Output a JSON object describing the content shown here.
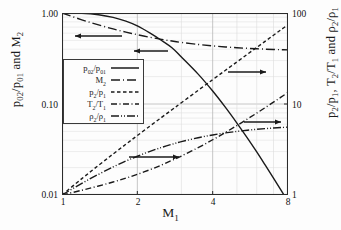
{
  "chart_data": {
    "type": "line",
    "title": "",
    "xlabel": "M1",
    "xlabel_html": "M<sub>1</sub>",
    "ylabel_left": "p02/p01 and M2",
    "ylabel_left_html": "p<sub>02</sub>/p<sub>01</sub>  and  M<sub>2</sub>",
    "ylabel_right": "p2/p1, T2/T1 and rho2/rho1",
    "ylabel_right_html": "p<sub>2</sub>/p<sub>1</sub>,  T<sub>2</sub>/T<sub>1</sub>  and  ρ<sub>2</sub>/ρ<sub>1</sub>",
    "xscale": "log",
    "yscale": "log",
    "xlim": [
      1,
      8
    ],
    "ylim_left": [
      0.01,
      1.0
    ],
    "ylim_right": [
      1,
      100
    ],
    "grid": true,
    "xticks": [
      1,
      2,
      4,
      8
    ],
    "xticklabels": [
      "1",
      "2",
      "4",
      "8"
    ],
    "yticks_left": [
      0.01,
      0.1,
      1.0
    ],
    "yticklabels_left": [
      "0.01",
      "0.10",
      "1.00"
    ],
    "yticks_right": [
      1,
      10,
      100
    ],
    "yticklabels_right": [
      "1",
      "10",
      "100"
    ],
    "legend_position": "center-left",
    "x": [
      1.0,
      1.2,
      1.4,
      1.6,
      1.8,
      2.0,
      2.25,
      2.5,
      2.75,
      3.0,
      3.5,
      4.0,
      4.5,
      5.0,
      5.5,
      6.0,
      6.5,
      7.0,
      7.5,
      8.0
    ],
    "series": [
      {
        "name": "p02/p01",
        "name_html": "p<sub>02</sub>/p<sub>01</sub>",
        "axis": "left",
        "style": "solid",
        "arrow": "left",
        "values": [
          1.0,
          0.9928,
          0.9582,
          0.8952,
          0.8127,
          0.7209,
          0.6005,
          0.499,
          0.4154,
          0.3283,
          0.2129,
          0.1388,
          0.0917,
          0.0617,
          0.0424,
          0.0297,
          0.0211,
          0.0153,
          0.0113,
          0.00849
        ]
      },
      {
        "name": "M2",
        "name_html": "M<sub>2</sub>",
        "axis": "left",
        "style": "longdash",
        "arrow": "left",
        "values": [
          1.0,
          0.8422,
          0.7397,
          0.6684,
          0.6165,
          0.5774,
          0.5406,
          0.513,
          0.4918,
          0.4752,
          0.4512,
          0.435,
          0.4236,
          0.4152,
          0.409,
          0.4042,
          0.4004,
          0.3974,
          0.3949,
          0.3929
        ]
      },
      {
        "name": "p2/p1",
        "name_html": "p<sub>2</sub>/p<sub>1</sub>",
        "axis": "right",
        "style": "shortdash",
        "arrow": "right",
        "values": [
          1.0,
          1.513,
          2.12,
          2.82,
          3.613,
          4.5,
          5.742,
          7.125,
          8.656,
          10.33,
          14.13,
          18.5,
          23.46,
          29.0,
          35.13,
          41.83,
          49.13,
          57.0,
          65.46,
          74.5
        ]
      },
      {
        "name": "T2/T1",
        "name_html": "T<sub>2</sub>/T<sub>1</sub>",
        "axis": "right",
        "style": "dashdot",
        "arrow": "right",
        "values": [
          1.0,
          1.128,
          1.255,
          1.388,
          1.532,
          1.688,
          1.901,
          2.138,
          2.4,
          2.679,
          3.315,
          4.047,
          4.875,
          5.8,
          6.822,
          7.941,
          9.156,
          10.47,
          11.88,
          13.39
        ]
      },
      {
        "name": "rho2/rho1",
        "name_html": "ρ<sub>2</sub>/ρ<sub>1</sub>",
        "axis": "right",
        "style": "dashdotdot",
        "arrow": "right",
        "values": [
          1.0,
          1.342,
          1.69,
          2.032,
          2.359,
          2.667,
          3.021,
          3.333,
          3.608,
          3.857,
          4.261,
          4.571,
          4.812,
          5.0,
          5.149,
          5.268,
          5.365,
          5.444,
          5.51,
          5.565
        ]
      }
    ],
    "annotations": [
      {
        "name": "arrow-to-left-axis-m2",
        "direction": "left",
        "x1": 122,
        "x2": 75,
        "y": 36
      },
      {
        "name": "arrow-to-left-axis-p02",
        "direction": "left",
        "x1": 168,
        "x2": 134,
        "y": 51
      },
      {
        "name": "arrow-to-right-axis-p2p1",
        "direction": "right",
        "x1": 228,
        "x2": 266,
        "y": 72
      },
      {
        "name": "arrow-to-right-axis-t2t1",
        "direction": "right",
        "x1": 244,
        "x2": 281,
        "y": 122
      },
      {
        "name": "arrow-to-right-axis-rho",
        "direction": "right",
        "x1": 129,
        "x2": 179,
        "y": 157
      }
    ],
    "colors": {
      "line": "#1a1a1a",
      "grid_major": "#b8b8b8",
      "grid_minor": "#dcdcdc",
      "axis": "#2b2b2b",
      "background": "#fdfdfd"
    }
  }
}
